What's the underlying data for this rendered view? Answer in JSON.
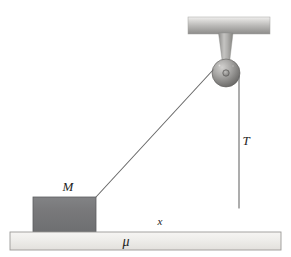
{
  "figure": {
    "canvas": {
      "width": 291,
      "height": 257,
      "background": "#ffffff"
    }
  },
  "labels": {
    "mass": "M",
    "distance": "x",
    "friction_coefficient": "μ",
    "tension": "T"
  },
  "colors": {
    "block_fill": "#77787a",
    "block_stroke": "#5d5e60",
    "ground_fill": "#eceae6",
    "ground_stroke": "#9b9a97",
    "ceiling_light": "#e4e3e1",
    "ceiling_dark": "#8f8e8c",
    "pulley_light": "#c9c8c6",
    "pulley_dark": "#6d6c6a",
    "bracket_fill": "#a8a7a5",
    "rope_stroke": "#6a6a6a",
    "text": "#1d1d1d"
  },
  "geometry": {
    "ceiling_bar": {
      "x": 188,
      "y": 17,
      "width": 82,
      "height": 17
    },
    "bracket": {
      "top_left_x": 218,
      "top_right_x": 233,
      "top_y": 33,
      "apex_x": 226,
      "apex_y": 72
    },
    "pulley": {
      "cx": 226,
      "cy": 73,
      "r": 14,
      "hub_r": 3.2
    },
    "block": {
      "x": 33,
      "y": 197,
      "width": 63,
      "height": 35
    },
    "ground": {
      "x": 10,
      "y": 232,
      "width": 271,
      "height": 18
    },
    "rope_diagonal": {
      "x1": 96,
      "y1": 197,
      "x2": 213,
      "y2": 70
    },
    "rope_vertical": {
      "x1": 239,
      "y1": 76,
      "x2": 239,
      "y2": 208
    }
  },
  "label_positions": {
    "mass": {
      "x": 68,
      "y": 191
    },
    "distance": {
      "x": 160,
      "y": 225
    },
    "friction_coefficient": {
      "x": 126,
      "y": 246
    },
    "tension": {
      "x": 246,
      "y": 145
    }
  }
}
